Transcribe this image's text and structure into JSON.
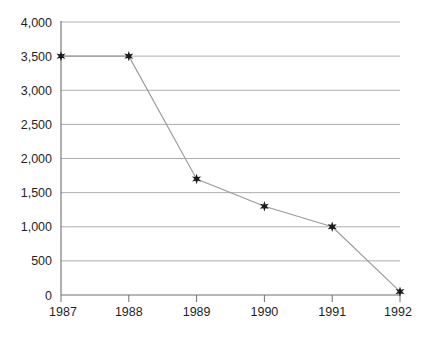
{
  "chart_data": {
    "type": "line",
    "title": "",
    "subtitle": "",
    "xlabel": "",
    "ylabel": "",
    "categories": [
      "1987",
      "1988",
      "1989",
      "1990",
      "1991",
      "1992"
    ],
    "x": [
      1987,
      1988,
      1989,
      1990,
      1991,
      1992
    ],
    "values": [
      3500,
      3500,
      1700,
      1300,
      1000,
      50
    ],
    "series": [
      {
        "name": "",
        "values": [
          3500,
          3500,
          1700,
          1300,
          1000,
          50
        ]
      }
    ],
    "xlim": [
      1987,
      1992
    ],
    "ylim": [
      0,
      4000
    ],
    "ytick_values": [
      0,
      500,
      1000,
      1500,
      2000,
      2500,
      3000,
      3500,
      4000
    ],
    "ytick_labels": [
      "0",
      "500",
      "1,000",
      "1,500",
      "2,000",
      "2,500",
      "3,000",
      "3,500",
      "4,000"
    ],
    "xtick_labels": [
      "1987",
      "1988",
      "1989",
      "1990",
      "1991",
      "1992"
    ],
    "grid": true,
    "grid_axis": "y",
    "legend": false,
    "legend_position": "none",
    "marker": "star",
    "marker_color": "#1a1a1a",
    "line_color": "#9a9a9a",
    "grid_color": "#aeaeae",
    "axis_color": "#6e6e6e",
    "background_color": "#ffffff",
    "annotations": []
  },
  "axes": {
    "y_axis_name": "y-axis",
    "x_axis_name": "x-axis"
  }
}
